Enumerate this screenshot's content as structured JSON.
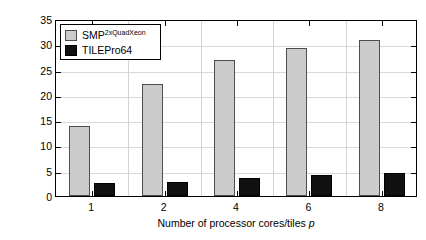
{
  "chart_data": {
    "type": "bar",
    "title": "",
    "xlabel": "Number of processor cores/tiles p",
    "xlabel_plain": "Number of processor cores/tiles ",
    "xlabel_italic": "p",
    "ylabel": "MFLOPS/W",
    "categories": [
      "1",
      "2",
      "4",
      "6",
      "8"
    ],
    "ylim": [
      0,
      35
    ],
    "yticks": [
      0,
      5,
      10,
      15,
      20,
      25,
      30,
      35
    ],
    "ytick_labels": [
      "0",
      "5",
      "10",
      "15",
      "20",
      "25",
      "30",
      "35"
    ],
    "grid": true,
    "legend_position": "upper left",
    "series": [
      {
        "name": "SMP",
        "name_superscript": "2xQuadXeon",
        "label": "SMP2xQuadXeon",
        "color": "#cccccc",
        "edge_color": "#4d4d4d",
        "values": [
          13.8,
          22.2,
          26.8,
          29.3,
          30.8
        ]
      },
      {
        "name": "TILEPro64",
        "name_superscript": "",
        "label": "TILEPro64",
        "color": "#111111",
        "edge_color": "#000000",
        "values": [
          2.6,
          2.7,
          3.6,
          4.1,
          4.6
        ]
      }
    ]
  }
}
